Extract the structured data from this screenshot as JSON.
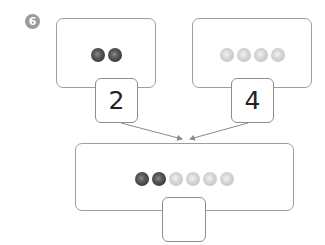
{
  "problem": {
    "number_badge": "6",
    "left_group": {
      "count": 2,
      "ball_color": "dark",
      "answer": "2"
    },
    "right_group": {
      "count": 4,
      "ball_color": "light",
      "answer": "4"
    },
    "combined_group": {
      "balls": [
        "dark",
        "dark",
        "light",
        "light",
        "light",
        "light"
      ],
      "answer": ""
    }
  },
  "colors": {
    "border": "#9e9e9e",
    "arrow": "#8a8a8a",
    "badge": "#9a9a9a",
    "dark_ball": "#3a3a3a",
    "light_ball": "#cfcfcf"
  }
}
